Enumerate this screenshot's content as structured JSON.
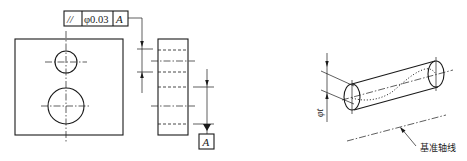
{
  "figure_left": {
    "feature_control_frame": {
      "symbol": "//",
      "symbol_name": "parallelism",
      "tolerance": "φ0.03",
      "datum": "A"
    },
    "datum_label": "A"
  },
  "figure_right": {
    "tolerance_zone_label": "φt",
    "datum_axis_label": "基准轴线"
  },
  "colors": {
    "line": "#1a1a1a",
    "background": "#ffffff"
  }
}
